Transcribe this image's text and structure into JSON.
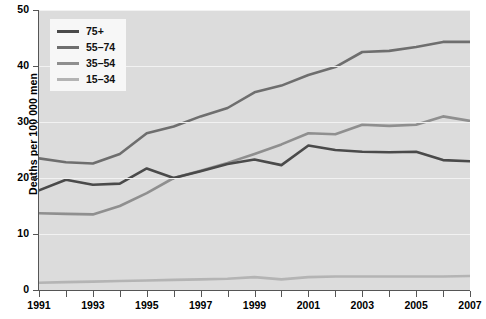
{
  "chart_data": {
    "type": "line",
    "title": "",
    "xlabel": "",
    "ylabel": "Deaths per 100 000 men",
    "xlim": [
      1991,
      2007
    ],
    "ylim": [
      0,
      50
    ],
    "yticks": [
      0,
      10,
      20,
      30,
      40,
      50
    ],
    "xticks": [
      1991,
      1992,
      1993,
      1994,
      1995,
      1996,
      1997,
      1998,
      1999,
      2000,
      2001,
      2002,
      2003,
      2004,
      2005,
      2006,
      2007
    ],
    "xtick_labels": [
      "1991",
      "",
      "1993",
      "",
      "1995",
      "",
      "1997",
      "",
      "1999",
      "",
      "2001",
      "",
      "2003",
      "",
      "2005",
      "",
      "2007"
    ],
    "grid": true,
    "legend_position": "top-left",
    "plot_background": "#dcdcdc",
    "x": [
      1991,
      1992,
      1993,
      1994,
      1995,
      1996,
      1997,
      1998,
      1999,
      2000,
      2001,
      2002,
      2003,
      2004,
      2005,
      2006,
      2007
    ],
    "series": [
      {
        "name": "75+",
        "color": "#4a4a4a",
        "values": [
          17.8,
          19.7,
          18.8,
          19.0,
          21.7,
          20.0,
          21.2,
          22.5,
          23.3,
          22.3,
          25.8,
          25.0,
          24.7,
          24.6,
          24.7,
          23.2,
          23.0
        ]
      },
      {
        "name": "55–74",
        "color": "#6e6e6e",
        "values": [
          23.5,
          22.8,
          22.6,
          24.3,
          28.0,
          29.2,
          31.0,
          32.5,
          35.3,
          36.5,
          38.4,
          39.8,
          42.5,
          42.7,
          43.4,
          44.3,
          44.3
        ]
      },
      {
        "name": "35–54",
        "color": "#8f8f8f",
        "values": [
          13.7,
          13.6,
          13.5,
          15.0,
          17.3,
          20.0,
          21.3,
          22.7,
          24.3,
          26.0,
          28.0,
          27.8,
          29.5,
          29.3,
          29.5,
          31.0,
          30.2
        ]
      },
      {
        "name": "15–34",
        "color": "#b4b4b4",
        "values": [
          1.3,
          1.4,
          1.5,
          1.6,
          1.7,
          1.8,
          1.9,
          2.0,
          2.3,
          1.9,
          2.3,
          2.4,
          2.4,
          2.4,
          2.4,
          2.4,
          2.5
        ]
      }
    ]
  },
  "axis": {
    "y_title": "Deaths per 100 000 men",
    "y_labels": [
      "50",
      "40",
      "30",
      "20",
      "10",
      "0"
    ],
    "x_labels": [
      "1991",
      "1993",
      "1995",
      "1997",
      "1999",
      "2001",
      "2003",
      "2005",
      "2007"
    ]
  },
  "legend": {
    "items": [
      {
        "label": "75+",
        "color": "#4a4a4a"
      },
      {
        "label": "55–74",
        "color": "#6e6e6e"
      },
      {
        "label": "35–54",
        "color": "#8f8f8f"
      },
      {
        "label": "15–34",
        "color": "#b4b4b4"
      }
    ]
  }
}
